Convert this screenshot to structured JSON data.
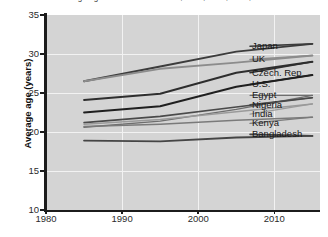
{
  "chart_data": {
    "type": "line",
    "title": "Average age in selected countries, 1985, 1995, 2005, 2015",
    "xlabel": "",
    "ylabel": "Average age (years)",
    "xlim": [
      1980,
      2016
    ],
    "ylim": [
      10,
      35
    ],
    "xticks": [
      1980,
      1990,
      2000,
      2010
    ],
    "yticks": [
      10,
      15,
      20,
      25,
      30,
      35
    ],
    "grid": true,
    "legend_position": "right-inline",
    "plot_background": "#d4d4d4",
    "gridline_color": "#f2f2f2",
    "x": [
      1985,
      1995,
      2005,
      2015
    ],
    "series": [
      {
        "name": "Japan",
        "color": "#3c3c3c",
        "width": 1.9,
        "values": [
          26.5,
          28.4,
          30.3,
          31.3
        ],
        "label_y": 31.0
      },
      {
        "name": "UK",
        "color": "#8c8c8c",
        "width": 1.9,
        "values": [
          26.5,
          28.1,
          28.9,
          29.8
        ],
        "label_y": 29.3
      },
      {
        "name": "Czech. Rep",
        "color": "#2e2e2e",
        "width": 1.9,
        "values": [
          24.1,
          24.9,
          27.6,
          29.0
        ],
        "label_y": 27.6
      },
      {
        "name": "U.S.",
        "color": "#1f1f1f",
        "width": 1.9,
        "values": [
          22.5,
          23.3,
          25.8,
          27.3
        ],
        "label_y": 26.1
      },
      {
        "name": "Egypt",
        "color": "#6e6e6e",
        "width": 1.4,
        "values": [
          20.6,
          21.4,
          22.9,
          24.7
        ],
        "label_y": 24.7
      },
      {
        "name": "Nigeria",
        "color": "#4a4a4a",
        "width": 1.6,
        "values": [
          21.2,
          22.0,
          23.2,
          24.4
        ],
        "label_y": 23.5
      },
      {
        "name": "India",
        "color": "#9a9a9a",
        "width": 1.5,
        "values": [
          21.0,
          21.6,
          22.6,
          23.6
        ],
        "label_y": 22.3
      },
      {
        "name": "Kenya",
        "color": "#7a7a7a",
        "width": 1.6,
        "values": [
          20.7,
          21.0,
          21.5,
          21.9
        ],
        "label_y": 21.1
      },
      {
        "name": "Bangladesh",
        "color": "#454545",
        "width": 1.9,
        "values": [
          18.9,
          18.8,
          19.3,
          19.5
        ],
        "label_y": 19.7
      }
    ]
  }
}
